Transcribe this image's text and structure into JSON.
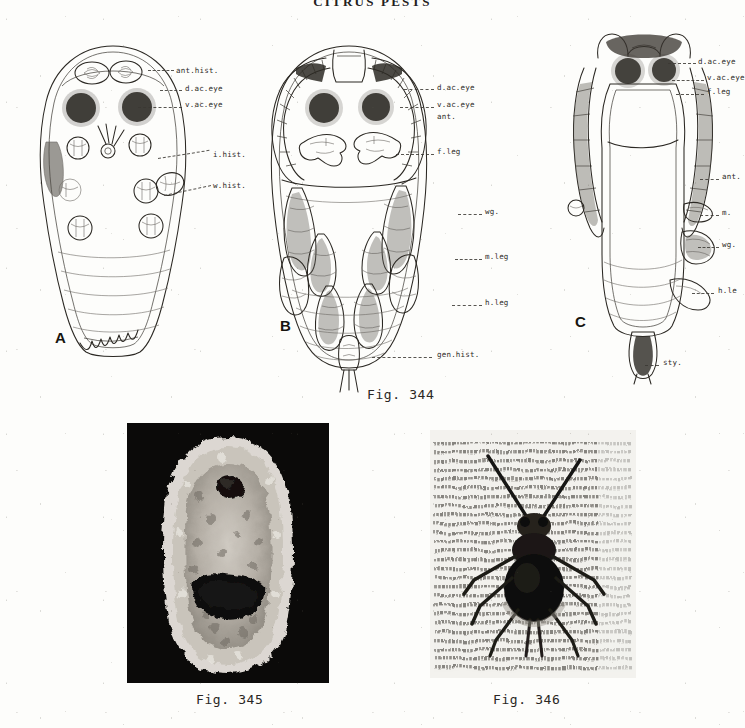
{
  "page": {
    "running_head": "CITRUS PESTS",
    "background_color": "#fdfdfb",
    "ink_color": "#2b2823"
  },
  "figures": [
    {
      "id": "fig-344",
      "caption": "Fig. 344",
      "panels": [
        {
          "letter": "A",
          "name": "dorsal-prepupa-diagram",
          "labels": [
            {
              "text": "ant.hist.",
              "x": 176,
              "y": 66
            },
            {
              "text": "d.ac.eye",
              "x": 185,
              "y": 87
            },
            {
              "text": "v.ac.eye",
              "x": 185,
              "y": 103
            },
            {
              "text": "i.hist.",
              "x": 213,
              "y": 155
            },
            {
              "text": "w.hist.",
              "x": 213,
              "y": 185
            }
          ]
        },
        {
          "letter": "B",
          "name": "ventral-pupa-diagram",
          "labels": [
            {
              "text": "d.ac.eye",
              "x": 437,
              "y": 86
            },
            {
              "text": "v.ac.eye",
              "x": 437,
              "y": 104
            },
            {
              "text": "ant.",
              "x": 437,
              "y": 116
            },
            {
              "text": "f.leg",
              "x": 437,
              "y": 151
            },
            {
              "text": "wg.",
              "x": 485,
              "y": 211
            },
            {
              "text": "m.leg",
              "x": 485,
              "y": 256
            },
            {
              "text": "h.leg",
              "x": 485,
              "y": 302
            },
            {
              "text": "gen.hist.",
              "x": 437,
              "y": 354
            }
          ]
        },
        {
          "letter": "C",
          "name": "lateral-pupa-diagram",
          "labels": [
            {
              "text": "d.ac.eye",
              "x": 698,
              "y": 60
            },
            {
              "text": "v.ac.eye",
              "x": 707,
              "y": 76
            },
            {
              "text": "f.leg",
              "x": 707,
              "y": 90
            },
            {
              "text": "ant.",
              "x": 722,
              "y": 176
            },
            {
              "text": "m.",
              "x": 722,
              "y": 212
            },
            {
              "text": "wg.",
              "x": 722,
              "y": 244
            },
            {
              "text": "h.le",
              "x": 718,
              "y": 290
            },
            {
              "text": "sty.",
              "x": 663,
              "y": 362
            }
          ]
        }
      ]
    },
    {
      "id": "fig-345",
      "caption": "Fig. 345",
      "name": "scale-insect-photomicrograph",
      "frame": {
        "x": 127,
        "y": 423,
        "w": 202,
        "h": 260
      },
      "background_color": "#0b0a09"
    },
    {
      "id": "fig-346",
      "caption": "Fig. 346",
      "name": "winged-insect-photograph",
      "frame": {
        "x": 430,
        "y": 430,
        "w": 206,
        "h": 248
      },
      "background_color": "#efeeea"
    }
  ],
  "captions": [
    {
      "text": "Fig. 344",
      "x": 367,
      "y": 392
    },
    {
      "text": "Fig. 345",
      "x": 196,
      "y": 697
    },
    {
      "text": "Fig. 346",
      "x": 493,
      "y": 697
    }
  ]
}
